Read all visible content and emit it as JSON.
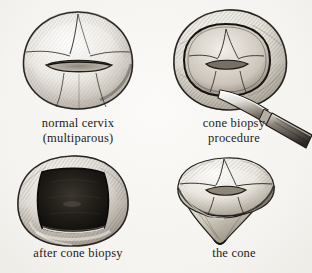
{
  "figure": {
    "style": "pen-and-ink medical illustration",
    "background_color": "#f7f6f3",
    "ink_color": "#1e1c1a",
    "panel_count": 4
  },
  "panels": [
    {
      "id": "normal-cervix",
      "caption_line1": "normal cervix",
      "caption_line2": "(multiparous)",
      "subject": "intact cervix, anterior view with transverse parous os",
      "position": "top-left"
    },
    {
      "id": "cone-biopsy-procedure",
      "caption_line1": "cone biopsy",
      "caption_line2": "procedure",
      "subject": "cervix with circular incision outline and scalpel blade",
      "position": "top-right",
      "instrument": "scalpel"
    },
    {
      "id": "after-cone-biopsy",
      "caption_line1": "after cone biopsy",
      "caption_line2": "",
      "subject": "cervix with dark conical defect after tissue removal",
      "position": "bottom-left"
    },
    {
      "id": "the-cone",
      "caption_line1": "the cone",
      "caption_line2": "",
      "subject": "excised cone-shaped specimen of cervical tissue",
      "position": "bottom-right"
    }
  ]
}
